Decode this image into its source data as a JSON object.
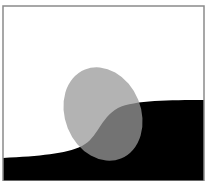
{
  "figure": {
    "colors": {
      "background": "#ffffff",
      "frame": "#8a8a8a",
      "dark_region": "#000000",
      "ellipse": "#9a9a9a",
      "ellipse_opacity": 0.75
    },
    "shapes": {
      "frame": {
        "x": 3,
        "y": 6,
        "width": 201,
        "height": 175
      },
      "ellipse": {
        "cx": 103,
        "cy": 114,
        "rx": 38,
        "ry": 48,
        "rotate": -22
      },
      "curve": "M3,158 C40,156 65,154 82,146 C98,138 100,118 118,108 C135,100 170,100 204,100 L204,181 L3,181 Z"
    }
  }
}
